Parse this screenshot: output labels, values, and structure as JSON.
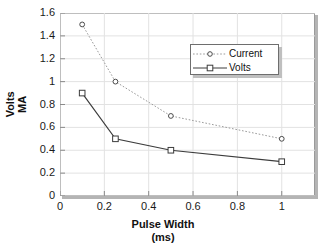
{
  "chart_data": {
    "type": "line",
    "title": "",
    "xlabel": "Pulse Width",
    "xlabel_units": "(ms)",
    "ylabel_left": "Volts",
    "ylabel_right": "MA",
    "grid": true,
    "legend_position": "upper-center-right",
    "xlim": [
      0,
      1.15
    ],
    "ylim": [
      0,
      1.6
    ],
    "xticks": [
      "0",
      "0.2",
      "0.4",
      "0.6",
      "0.8",
      "1"
    ],
    "xtick_values": [
      0,
      0.2,
      0.4,
      0.6,
      0.8,
      1
    ],
    "yticks": [
      "0",
      "0.2",
      "0.4",
      "0.6",
      "0.8",
      "1",
      "1.2",
      "1.4",
      "1.6"
    ],
    "ytick_values": [
      0,
      0.2,
      0.4,
      0.6,
      0.8,
      1,
      1.2,
      1.4,
      1.6
    ],
    "x": [
      0.1,
      0.25,
      0.5,
      1.0
    ],
    "series": [
      {
        "name": "Current",
        "values": [
          1.5,
          1.0,
          0.7,
          0.5
        ],
        "line_style": "dotted",
        "marker": "circle",
        "color": "#9a9a9a"
      },
      {
        "name": "Volts",
        "values": [
          0.9,
          0.5,
          0.4,
          0.3
        ],
        "line_style": "solid",
        "marker": "square",
        "color": "#3c3c3c"
      }
    ]
  },
  "legend": {
    "entries": [
      {
        "label": "Current"
      },
      {
        "label": "Volts"
      }
    ]
  },
  "colors": {
    "background": "#ffffff",
    "frame": "#9a9a9a",
    "grid": "#e2e2e2",
    "text": "#111111",
    "current": "#9a9a9a",
    "volts": "#3c3c3c",
    "shadow": "#bfbfbf"
  }
}
